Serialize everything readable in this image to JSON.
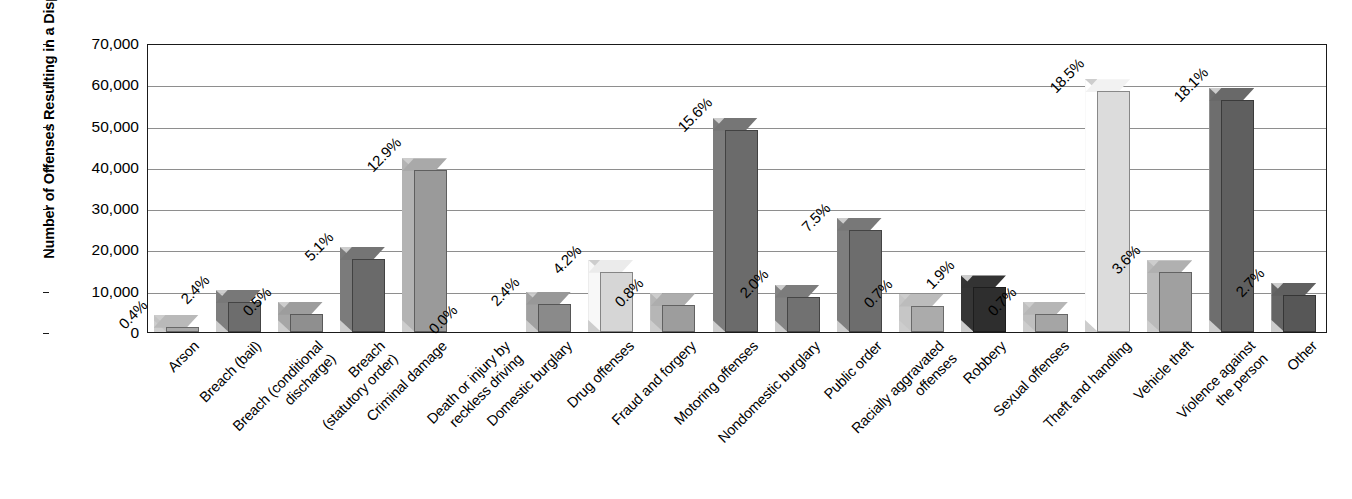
{
  "chart_data": {
    "type": "bar",
    "title": "",
    "xlabel": "",
    "ylabel": "Number of Offenses Resulting in a Disposal",
    "ylim": [
      0,
      70000
    ],
    "ytick_labels": [
      "0",
      "10,000",
      "20,000",
      "30,000",
      "40,000",
      "50,000",
      "60,000",
      "70,000"
    ],
    "ytick_values": [
      0,
      10000,
      20000,
      30000,
      40000,
      50000,
      60000,
      70000
    ],
    "grid": "horizontal",
    "legend": "none",
    "style": "3d-column",
    "categories": [
      "Arson",
      "Breach (bail)",
      "Breach (conditional discharge)",
      "Breach (statutory order)",
      "Criminal damage",
      "Death or injury by reckless driving",
      "Domestic burglary",
      "Drug offenses",
      "Fraud and forgery",
      "Motoring offenses",
      "Nondomestic burglary",
      "Public order",
      "Racially aggravated offenses",
      "Robbery",
      "Sexual offenses",
      "Theft and handling",
      "Vehicle theft",
      "Violence against the person",
      "Other"
    ],
    "category_label_lines": [
      [
        "Arson"
      ],
      [
        "Breach (bail)"
      ],
      [
        "Breach (conditional",
        "discharge)"
      ],
      [
        "Breach",
        "(statutory order)"
      ],
      [
        "Criminal damage"
      ],
      [
        "Death or injury by",
        "reckless driving"
      ],
      [
        "Domestic burglary"
      ],
      [
        "Drug offenses"
      ],
      [
        "Fraud and forgery"
      ],
      [
        "Motoring offenses"
      ],
      [
        "Nondomestic burglary"
      ],
      [
        "Public order"
      ],
      [
        "Racially aggravated",
        "offenses"
      ],
      [
        "Robbery"
      ],
      [
        "Sexual offenses"
      ],
      [
        "Theft and handling"
      ],
      [
        "Vehicle theft"
      ],
      [
        "Violence against",
        "the person"
      ],
      [
        "Other"
      ]
    ],
    "values": [
      1300,
      7300,
      4400,
      17700,
      39200,
      0,
      6900,
      14600,
      6500,
      49000,
      8600,
      24800,
      6400,
      10800,
      4400,
      58300,
      14500,
      56200,
      9000
    ],
    "data_labels": [
      "0.4%",
      "2.4%",
      "0.5%",
      "5.1%",
      "12.9%",
      "0.0%",
      "2.4%",
      "4.2%",
      "0.8%",
      "15.6%",
      "2.0%",
      "7.5%",
      "0.7%",
      "1.9%",
      "0.7%",
      "18.5%",
      "3.6%",
      "18.1%",
      "2.7%"
    ],
    "percentages": [
      0.4,
      2.4,
      0.5,
      5.1,
      12.9,
      0.0,
      2.4,
      4.2,
      0.8,
      15.6,
      2.0,
      7.5,
      0.7,
      1.9,
      0.7,
      18.5,
      3.6,
      18.1,
      2.7
    ],
    "bar_colors": [
      "#a8a8a8",
      "#6d6d6d",
      "#8f8f8f",
      "#6a6a6a",
      "#9a9a9a",
      "#ffffff",
      "#8a8a8a",
      "#d6d6d6",
      "#9d9d9d",
      "#6b6b6b",
      "#717171",
      "#6d6d6d",
      "#ababab",
      "#2e2e2e",
      "#a5a5a5",
      "#dcdcdc",
      "#a0a0a0",
      "#5f5f5f",
      "#575757"
    ],
    "shadow_color": "#c9c9c9",
    "axis_color": "#1a1a1a",
    "grid_color": "#8e8e8e"
  }
}
